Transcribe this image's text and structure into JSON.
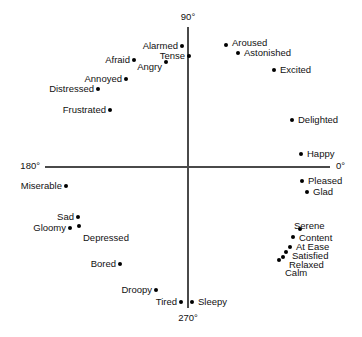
{
  "chart_data": {
    "type": "scatter",
    "title": "",
    "xlabel": "",
    "ylabel": "",
    "xlim": [
      -1,
      1
    ],
    "ylim": [
      -1,
      1
    ],
    "grid": false,
    "legend": null,
    "axis_labels": [
      {
        "text": "90°",
        "position": "top"
      },
      {
        "text": "0°",
        "position": "right"
      },
      {
        "text": "180°",
        "position": "left"
      },
      {
        "text": "270°",
        "position": "bottom"
      }
    ],
    "point_labels": [
      "Alarmed",
      "Tense",
      "Afraid",
      "Angry",
      "Annoyed",
      "Distressed",
      "Frustrated",
      "Aroused",
      "Astonished",
      "Excited",
      "Delighted",
      "Happy",
      "Pleased",
      "Glad",
      "Serene",
      "Content",
      "At Ease",
      "Satisfied",
      "Relaxed",
      "Calm",
      "Miserable",
      "Sad",
      "Gloomy",
      "Depressed",
      "Bored",
      "Droopy",
      "Tired",
      "Sleepy"
    ],
    "points": [
      {
        "label": "Alarmed",
        "px": 182,
        "py": 46,
        "label_x": 178,
        "label_y": 46,
        "align": "left"
      },
      {
        "label": "Tense",
        "px": 189,
        "py": 56,
        "label_x": 185,
        "label_y": 56,
        "align": "left"
      },
      {
        "label": "Afraid",
        "px": 134,
        "py": 60,
        "label_x": 130,
        "label_y": 60,
        "align": "left"
      },
      {
        "label": "Angry",
        "px": 166,
        "py": 62,
        "label_x": 162,
        "label_y": 67,
        "align": "left"
      },
      {
        "label": "Annoyed",
        "px": 126,
        "py": 79,
        "label_x": 122,
        "label_y": 79,
        "align": "left"
      },
      {
        "label": "Distressed",
        "px": 98,
        "py": 89,
        "label_x": 94,
        "label_y": 89,
        "align": "left"
      },
      {
        "label": "Frustrated",
        "px": 110,
        "py": 110,
        "label_x": 106,
        "label_y": 110,
        "align": "left"
      },
      {
        "label": "Aroused",
        "px": 226,
        "py": 45,
        "label_x": 232,
        "label_y": 43,
        "align": "right"
      },
      {
        "label": "Astonished",
        "px": 238,
        "py": 53,
        "label_x": 244,
        "label_y": 53,
        "align": "right"
      },
      {
        "label": "Excited",
        "px": 274,
        "py": 70,
        "label_x": 280,
        "label_y": 70,
        "align": "right"
      },
      {
        "label": "Delighted",
        "px": 292,
        "py": 120,
        "label_x": 298,
        "label_y": 120,
        "align": "right"
      },
      {
        "label": "Happy",
        "px": 301,
        "py": 154,
        "label_x": 307,
        "label_y": 154,
        "align": "right"
      },
      {
        "label": "Pleased",
        "px": 302,
        "py": 181,
        "label_x": 308,
        "label_y": 181,
        "align": "right"
      },
      {
        "label": "Glad",
        "px": 307,
        "py": 192,
        "label_x": 313,
        "label_y": 192,
        "align": "right"
      },
      {
        "label": "Serene",
        "px": 300,
        "py": 229,
        "label_x": 294,
        "label_y": 226,
        "align": "right"
      },
      {
        "label": "Content",
        "px": 293,
        "py": 237,
        "label_x": 299,
        "label_y": 238,
        "align": "right"
      },
      {
        "label": "At Ease",
        "px": 290,
        "py": 247,
        "label_x": 296,
        "label_y": 247,
        "align": "right"
      },
      {
        "label": "Satisfied",
        "px": 286,
        "py": 252,
        "label_x": 292,
        "label_y": 256,
        "align": "right"
      },
      {
        "label": "Relaxed",
        "px": 283,
        "py": 257,
        "label_x": 289,
        "label_y": 265,
        "align": "right"
      },
      {
        "label": "Calm",
        "px": 279,
        "py": 260,
        "label_x": 285,
        "label_y": 273,
        "align": "right"
      },
      {
        "label": "Miserable",
        "px": 66,
        "py": 186,
        "label_x": 62,
        "label_y": 186,
        "align": "left"
      },
      {
        "label": "Sad",
        "px": 78,
        "py": 217,
        "label_x": 74,
        "label_y": 217,
        "align": "left"
      },
      {
        "label": "Gloomy",
        "px": 70,
        "py": 228,
        "label_x": 66,
        "label_y": 228,
        "align": "left"
      },
      {
        "label": "Depressed",
        "px": 79,
        "py": 226,
        "label_x": 83,
        "label_y": 238,
        "align": "right"
      },
      {
        "label": "Bored",
        "px": 120,
        "py": 264,
        "label_x": 116,
        "label_y": 264,
        "align": "left"
      },
      {
        "label": "Droopy",
        "px": 156,
        "py": 290,
        "label_x": 152,
        "label_y": 290,
        "align": "left"
      },
      {
        "label": "Tired",
        "px": 181,
        "py": 302,
        "label_x": 177,
        "label_y": 302,
        "align": "left"
      },
      {
        "label": "Sleepy",
        "px": 192,
        "py": 302,
        "label_x": 198,
        "label_y": 302,
        "align": "right"
      }
    ],
    "axes_geometry": {
      "center_x": 188,
      "center_y": 167,
      "h_start_x": 45,
      "h_end_x": 330,
      "v_start_y": 27,
      "v_end_y": 308
    },
    "degree_label_positions": {
      "top": {
        "x": 188,
        "y": 12
      },
      "right": {
        "x": 336,
        "y": 161
      },
      "left": {
        "x": 40,
        "y": 161
      },
      "bottom": {
        "x": 188,
        "y": 313
      }
    }
  }
}
